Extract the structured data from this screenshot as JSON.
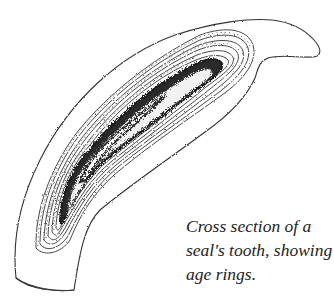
{
  "figure": {
    "caption_lines": [
      "Cross section of a",
      "seal's tooth, showing",
      "age rings."
    ],
    "colors": {
      "outline": "#333333",
      "pulp_dark": "#2a2a2a",
      "background": "#ffffff"
    }
  }
}
